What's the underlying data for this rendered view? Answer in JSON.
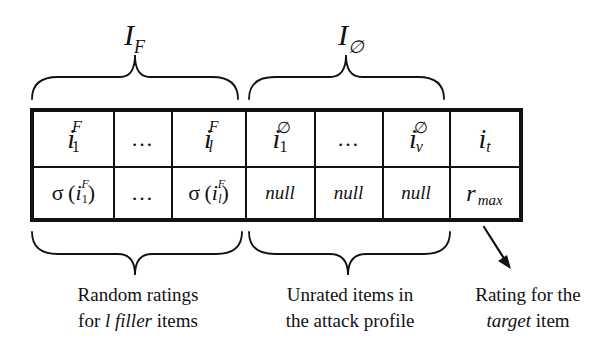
{
  "groups_top": {
    "filler": {
      "symbol": "I",
      "subscript": "F"
    },
    "unrated": {
      "symbol": "I",
      "subscript": "∅"
    }
  },
  "table": {
    "header_row": [
      {
        "base": "i",
        "sup": "F",
        "sub": "1"
      },
      {
        "text": "…"
      },
      {
        "base": "i",
        "sup": "F",
        "sub": "l"
      },
      {
        "base": "i",
        "sup": "∅",
        "sub": "1"
      },
      {
        "text": "…"
      },
      {
        "base": "i",
        "sup": "∅",
        "sub": "v"
      },
      {
        "base": "i",
        "sub": "t"
      }
    ],
    "value_row": [
      {
        "prefix": "σ",
        "base": "i",
        "sup": "F",
        "sub": "1"
      },
      {
        "text": "…"
      },
      {
        "prefix": "σ",
        "base": "i",
        "sup": "F",
        "sub": "l"
      },
      {
        "text": "null"
      },
      {
        "text": "null"
      },
      {
        "text": "null"
      },
      {
        "base": "r",
        "sub": "max"
      }
    ]
  },
  "labels_bottom": {
    "filler": {
      "line1": "Random ratings",
      "line2_pre": "for ",
      "line2_italic1": "l filler",
      "line2_post": " items"
    },
    "unrated": {
      "line1": "Unrated items in",
      "line2": "the attack profile"
    },
    "target": {
      "line1": "Rating for the",
      "line2_italic": "target",
      "line2_post": " item"
    }
  },
  "colors": {
    "ink": "#111111",
    "background": "#ffffff"
  }
}
